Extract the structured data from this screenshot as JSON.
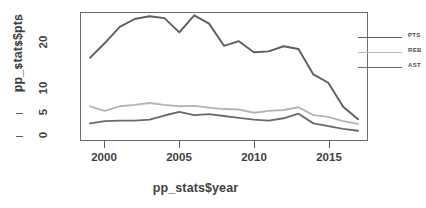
{
  "chart_data": {
    "type": "line",
    "title": "",
    "xlabel": "pp_stats$year",
    "ylabel": "pp_stats$pts",
    "xlim": [
      1998.4,
      2017.6
    ],
    "ylim": [
      -1.0,
      26.5
    ],
    "grid": false,
    "legend_position": "top-right",
    "x": [
      1999,
      2000,
      2001,
      2002,
      2003,
      2004,
      2005,
      2006,
      2007,
      2008,
      2009,
      2010,
      2011,
      2012,
      2013,
      2014,
      2015,
      2016,
      2017
    ],
    "series": [
      {
        "name": "PTS",
        "color": "#5e5e5e",
        "values": [
          16.8,
          20.0,
          23.5,
          25.2,
          25.8,
          25.4,
          22.3,
          26.0,
          24.2,
          19.4,
          20.4,
          18.0,
          18.2,
          19.3,
          18.7,
          13.2,
          11.4,
          6.2,
          3.5
        ]
      },
      {
        "name": "REB",
        "color": "#b5b5b5",
        "values": [
          6.3,
          5.3,
          6.3,
          6.6,
          7.0,
          6.6,
          6.3,
          6.4,
          6.0,
          5.7,
          5.6,
          4.9,
          5.3,
          5.5,
          6.1,
          4.4,
          4.0,
          3.1,
          2.5
        ]
      },
      {
        "name": "AST",
        "color": "#6a6a6a",
        "values": [
          2.6,
          3.1,
          3.2,
          3.2,
          3.4,
          4.3,
          5.1,
          4.4,
          4.6,
          4.2,
          3.8,
          3.4,
          3.2,
          3.7,
          4.7,
          2.6,
          2.0,
          1.4,
          1.0
        ]
      }
    ],
    "y_ticks": [
      0,
      5,
      10,
      20
    ],
    "y_ticks_all": [
      0,
      5,
      10,
      15,
      20,
      25
    ],
    "x_ticks": [
      2000,
      2005,
      2010,
      2015
    ]
  },
  "axes": {
    "y_label": "pp_stats$pts",
    "x_label": "pp_stats$year",
    "y_tick_labels": [
      "0",
      "5",
      "10",
      "20"
    ],
    "x_tick_labels": [
      "2000",
      "2005",
      "2010",
      "2015"
    ]
  },
  "legend": {
    "entries": [
      {
        "label": "PTS",
        "color": "#5e5e5e"
      },
      {
        "label": "REB",
        "color": "#b5b5b5"
      },
      {
        "label": "AST",
        "color": "#6a6a6a"
      }
    ]
  }
}
